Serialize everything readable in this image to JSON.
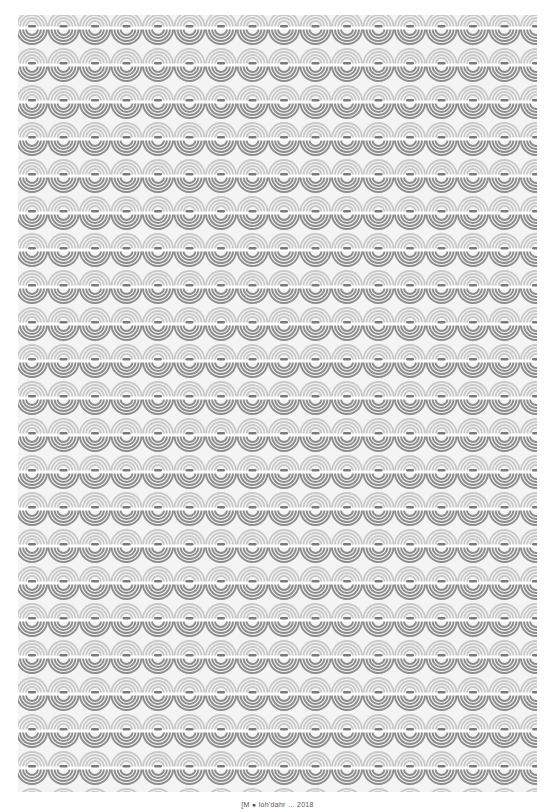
{
  "artwork": {
    "pattern_name": "concentric-arc-wallpaper-pattern",
    "tile_width": 31.5,
    "row_height": 37,
    "rows": 21,
    "columns": 17,
    "colors": {
      "background": "#f4f4f4",
      "upper_arcs": "#c9c9c9",
      "lower_arcs": "#8c8c8c",
      "center_band": "#ffffff",
      "pill": "#7a7a7a"
    }
  },
  "caption": {
    "text": "[M ● loh'dahr ... 2018"
  }
}
